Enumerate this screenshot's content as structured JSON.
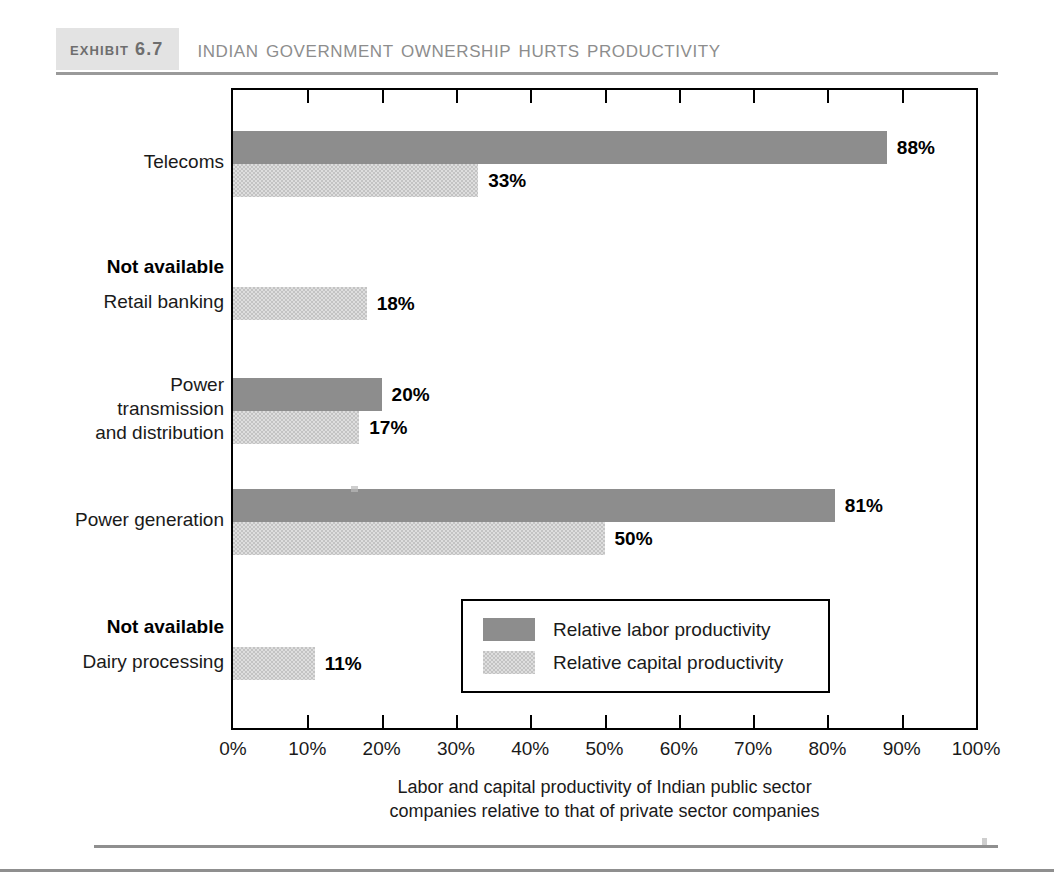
{
  "exhibit": {
    "tag": "Exhibit 6.7",
    "title": "Indian Government Ownership Hurts Productivity"
  },
  "chart_data": {
    "type": "bar",
    "orientation": "horizontal",
    "title": "Indian Government Ownership Hurts Productivity",
    "xlabel": "Labor and capital productivity of Indian public sector companies relative to that of private sector companies",
    "ylabel": "",
    "xlim": [
      0,
      100
    ],
    "xunit": "%",
    "grid": false,
    "legend_position": "inside-bottom-center",
    "categories": [
      "Telecoms",
      "Retail banking",
      "Power transmission and distribution",
      "Power generation",
      "Dairy processing"
    ],
    "series": [
      {
        "name": "Relative labor productivity",
        "color": "#8d8d8d",
        "values": [
          88,
          null,
          20,
          81,
          null
        ],
        "labels": [
          "88%",
          "Not available",
          "20%",
          "81%",
          "Not available"
        ]
      },
      {
        "name": "Relative capital productivity",
        "color": "#c3c3c3",
        "values": [
          33,
          18,
          17,
          50,
          11
        ],
        "labels": [
          "33%",
          "18%",
          "17%",
          "50%",
          "11%"
        ]
      }
    ],
    "xticks": [
      "0%",
      "10%",
      "20%",
      "30%",
      "40%",
      "50%",
      "60%",
      "70%",
      "80%",
      "90%",
      "100%"
    ],
    "annotations": [
      "Not available"
    ]
  },
  "groups": [
    {
      "label": "Telecoms",
      "label_lines": [
        "Telecoms"
      ],
      "na_label": null,
      "bars": [
        {
          "series": "labor",
          "value": 88,
          "label": "88%"
        },
        {
          "series": "capital",
          "value": 33,
          "label": "33%"
        }
      ]
    },
    {
      "label": "Retail banking",
      "label_lines": [
        "Retail banking"
      ],
      "na_label": "Not available",
      "bars": [
        {
          "series": "capital",
          "value": 18,
          "label": "18%"
        }
      ]
    },
    {
      "label": "Power transmission and distribution",
      "label_lines": [
        "Power",
        "transmission",
        "and distribution"
      ],
      "na_label": null,
      "bars": [
        {
          "series": "labor",
          "value": 20,
          "label": "20%"
        },
        {
          "series": "capital",
          "value": 17,
          "label": "17%"
        }
      ]
    },
    {
      "label": "Power generation",
      "label_lines": [
        "Power generation"
      ],
      "na_label": null,
      "bars": [
        {
          "series": "labor",
          "value": 81,
          "label": "81%"
        },
        {
          "series": "capital",
          "value": 50,
          "label": "50%"
        }
      ]
    },
    {
      "label": "Dairy processing",
      "label_lines": [
        "Dairy processing"
      ],
      "na_label": "Not available",
      "bars": [
        {
          "series": "capital",
          "value": 11,
          "label": "11%"
        }
      ]
    }
  ],
  "legend": {
    "items": [
      {
        "key": "labor",
        "label": "Relative labor productivity"
      },
      {
        "key": "capital",
        "label": "Relative capital productivity"
      }
    ]
  },
  "xaxis": {
    "ticks": [
      "0%",
      "10%",
      "20%",
      "30%",
      "40%",
      "50%",
      "60%",
      "70%",
      "80%",
      "90%",
      "100%"
    ],
    "caption_line1": "Labor and capital productivity of Indian public sector",
    "caption_line2": "companies relative to that of private sector companies"
  },
  "colors": {
    "labor": "#8d8d8d",
    "capital": "#c3c3c3",
    "header_band": "#e3e3e3",
    "header_text": "#6e6e6e",
    "title_text": "#8d8d8d",
    "rule": "#8f8f8f",
    "axis": "#000000"
  }
}
